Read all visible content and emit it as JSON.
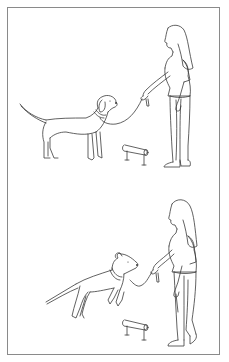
{
  "figure": {
    "type": "line-art illustration",
    "panels": [
      {
        "id": "top",
        "description": "Woman standing holding a leash; dog standing calmly looking up at her; low jump bar on the ground",
        "subjects": [
          "woman",
          "dog-standing",
          "leash",
          "jump-bar"
        ]
      },
      {
        "id": "bottom",
        "description": "Woman walking holding leash; dog leaping forward toward her hand; low jump bar on the ground",
        "subjects": [
          "woman",
          "dog-jumping",
          "leash",
          "jump-bar"
        ]
      }
    ],
    "colors": {
      "line": "#3a3a3a",
      "frame": "#8a8a8a",
      "background": "#ffffff"
    }
  }
}
